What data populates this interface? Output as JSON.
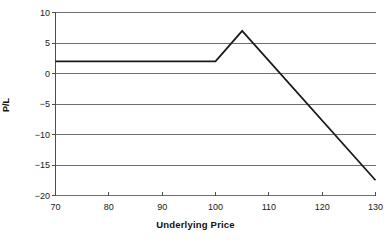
{
  "chart_data": {
    "type": "line",
    "title": "",
    "xlabel": "Underlying Price",
    "ylabel": "P/L",
    "xlim": [
      70,
      130
    ],
    "ylim": [
      -20,
      10
    ],
    "grid": true,
    "legend": null,
    "x_ticks": [
      70,
      80,
      90,
      100,
      110,
      120,
      130
    ],
    "x_tick_labels": [
      "70",
      "80",
      "90",
      "100",
      "110",
      "120",
      "130"
    ],
    "y_ticks": [
      10,
      5,
      0,
      -5,
      -10,
      -15,
      -20
    ],
    "y_tick_labels": [
      "10",
      "5",
      "0",
      "−5",
      "−10",
      "−15",
      "−20"
    ],
    "series": [
      {
        "name": "P/L",
        "color": "#1a1a1a",
        "line_width": 1.8,
        "x": [
          70,
          100,
          105,
          130
        ],
        "values": [
          2,
          2,
          7,
          -17.5
        ]
      }
    ],
    "annotations": {
      "flat_profit": 2,
      "peak_price": 105,
      "peak_profit": 7,
      "breakeven_price": 112,
      "end_price": 130,
      "end_loss": -17.5
    }
  },
  "style": {
    "background": "#ffffff",
    "grid_color": "#6f6f6f",
    "axis_color": "#4d4d4d",
    "text_color": "#1a1a1a"
  }
}
